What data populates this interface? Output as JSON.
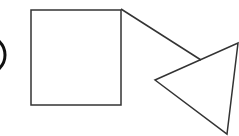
{
  "diagram": {
    "canvas": {
      "width": 239,
      "height": 136,
      "background": "#ffffff"
    },
    "stroke_color": "#333333",
    "arc_color": "#111111",
    "shapes": {
      "partial_circle": {
        "cx": -14,
        "cy": 55,
        "r": 19,
        "stroke_width": 3
      },
      "square": {
        "x": 31,
        "y": 10,
        "width": 90,
        "height": 95,
        "stroke_width": 1.5
      },
      "connector": {
        "x1": 121,
        "y1": 9,
        "x2": 201,
        "y2": 60,
        "stroke_width": 1.5
      },
      "triangle": {
        "points": "155,80 238,43 227,134",
        "stroke_width": 1.5
      }
    }
  }
}
